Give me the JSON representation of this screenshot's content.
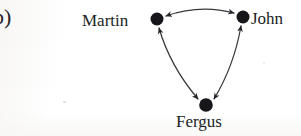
{
  "figure": {
    "panel_label": "b)",
    "background_color": "#fbfaf8",
    "ink_color": "#201e24",
    "width": 301,
    "height": 136
  },
  "graph": {
    "type": "directed-graph",
    "layout": "triangle",
    "node_color": "#17161a",
    "edge_color": "#3a383c",
    "node_radius": 6.5,
    "nodes": [
      {
        "id": "martin",
        "label": "Martin",
        "x": 157,
        "y": 19,
        "label_side": "left"
      },
      {
        "id": "john",
        "label": "John",
        "x": 243,
        "y": 17,
        "label_side": "right"
      },
      {
        "id": "fergus",
        "label": "Fergus",
        "x": 206,
        "y": 105,
        "label_side": "below"
      }
    ],
    "edges": [
      {
        "from": "martin",
        "to": "john",
        "directed": "both",
        "curve": "arc-up"
      },
      {
        "from": "martin",
        "to": "fergus",
        "directed": "both",
        "curve": "arc-left"
      },
      {
        "from": "john",
        "to": "fergus",
        "directed": "both",
        "curve": "arc-right"
      }
    ]
  }
}
